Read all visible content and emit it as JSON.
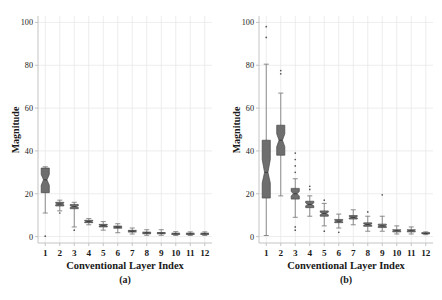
{
  "figure": {
    "background_color": "#ffffff",
    "box_fill_color": "#6e6e6e",
    "box_edge_color": "#4a4a4a",
    "whisker_color": "#808080",
    "grid_color": "#e8e8e8",
    "axis_color": "#bdbdbd",
    "text_color": "#1a1a1a"
  },
  "chart_data": [
    {
      "type": "box",
      "panel": "a",
      "caption": "(a)",
      "title": "",
      "xlabel": "Conventional Layer Index",
      "ylabel": "Magnitude",
      "categories": [
        "1",
        "2",
        "3",
        "4",
        "5",
        "6",
        "7",
        "8",
        "9",
        "10",
        "11",
        "12"
      ],
      "ytick_labels": [
        "0",
        "20",
        "40",
        "60",
        "80",
        "100"
      ],
      "yticks": [
        0,
        20,
        40,
        60,
        80,
        100
      ],
      "ylim": [
        -3,
        103
      ],
      "grid": true,
      "notched": true,
      "boxes": [
        {
          "x": 1,
          "whisker_low": 11.0,
          "q1": 20.5,
          "median": 26.5,
          "q3": 32.0,
          "whisker_high": 32.6,
          "notch_low": 24.0,
          "notch_high": 29.0,
          "outliers": [
            0.2
          ]
        },
        {
          "x": 2,
          "whisker_low": 12.0,
          "q1": 14.3,
          "median": 15.2,
          "q3": 16.0,
          "whisker_high": 17.0,
          "notch_low": 14.9,
          "notch_high": 15.6,
          "outliers": [
            11.0
          ]
        },
        {
          "x": 3,
          "whisker_low": 4.5,
          "q1": 13.0,
          "median": 14.0,
          "q3": 15.0,
          "whisker_high": 16.0,
          "notch_low": 13.6,
          "notch_high": 14.4,
          "outliers": [
            3.0
          ]
        },
        {
          "x": 4,
          "whisker_low": 5.5,
          "q1": 6.5,
          "median": 7.0,
          "q3": 7.6,
          "whisker_high": 8.4,
          "notch_low": 6.8,
          "notch_high": 7.3,
          "outliers": []
        },
        {
          "x": 5,
          "whisker_low": 3.0,
          "q1": 4.5,
          "median": 5.1,
          "q3": 5.7,
          "whisker_high": 7.0,
          "notch_low": 4.9,
          "notch_high": 5.4,
          "outliers": []
        },
        {
          "x": 6,
          "whisker_low": 1.8,
          "q1": 3.9,
          "median": 4.4,
          "q3": 4.9,
          "whisker_high": 6.0,
          "notch_low": 4.2,
          "notch_high": 4.7,
          "outliers": []
        },
        {
          "x": 7,
          "whisker_low": 1.2,
          "q1": 2.1,
          "median": 2.5,
          "q3": 2.9,
          "whisker_high": 4.0,
          "notch_low": 2.3,
          "notch_high": 2.7,
          "outliers": []
        },
        {
          "x": 8,
          "whisker_low": 0.6,
          "q1": 1.3,
          "median": 1.7,
          "q3": 2.1,
          "whisker_high": 3.2,
          "notch_low": 1.5,
          "notch_high": 1.9,
          "outliers": []
        },
        {
          "x": 9,
          "whisker_low": 0.6,
          "q1": 1.3,
          "median": 1.6,
          "q3": 1.9,
          "whisker_high": 3.2,
          "notch_low": 1.5,
          "notch_high": 1.8,
          "outliers": []
        },
        {
          "x": 10,
          "whisker_low": 0.5,
          "q1": 1.0,
          "median": 1.3,
          "q3": 1.6,
          "whisker_high": 2.3,
          "notch_low": 1.2,
          "notch_high": 1.5,
          "outliers": []
        },
        {
          "x": 11,
          "whisker_low": 0.5,
          "q1": 1.0,
          "median": 1.3,
          "q3": 1.6,
          "whisker_high": 2.2,
          "notch_low": 1.2,
          "notch_high": 1.5,
          "outliers": []
        },
        {
          "x": 12,
          "whisker_low": 0.5,
          "q1": 1.0,
          "median": 1.3,
          "q3": 1.6,
          "whisker_high": 2.2,
          "notch_low": 1.2,
          "notch_high": 1.5,
          "outliers": []
        }
      ]
    },
    {
      "type": "box",
      "panel": "b",
      "caption": "(b)",
      "title": "",
      "xlabel": "Conventional Layer Index",
      "ylabel": "Magnitude",
      "categories": [
        "1",
        "2",
        "3",
        "4",
        "5",
        "6",
        "7",
        "8",
        "9",
        "10",
        "11",
        "12"
      ],
      "ytick_labels": [
        "0",
        "20",
        "40",
        "60",
        "80",
        "100"
      ],
      "yticks": [
        0,
        20,
        40,
        60,
        80,
        100
      ],
      "ylim": [
        -3,
        103
      ],
      "grid": true,
      "notched": true,
      "boxes": [
        {
          "x": 1,
          "whisker_low": 0.5,
          "q1": 18.0,
          "median": 30.0,
          "q3": 45.0,
          "whisker_high": 80.5,
          "notch_low": 25.0,
          "notch_high": 36.0,
          "outliers": [
            93.0,
            98.0
          ]
        },
        {
          "x": 2,
          "whisker_low": 19.0,
          "q1": 38.0,
          "median": 45.0,
          "q3": 52.0,
          "whisker_high": 67.0,
          "notch_low": 42.0,
          "notch_high": 48.0,
          "outliers": [
            76.0,
            77.5
          ]
        },
        {
          "x": 3,
          "whisker_low": 9.0,
          "q1": 17.5,
          "median": 20.0,
          "q3": 22.5,
          "whisker_high": 27.0,
          "notch_low": 19.0,
          "notch_high": 21.0,
          "outliers": [
            3.0,
            4.5,
            30.0,
            33.0,
            36.0,
            39.0
          ]
        },
        {
          "x": 4,
          "whisker_low": 9.5,
          "q1": 13.5,
          "median": 15.0,
          "q3": 16.5,
          "whisker_high": 19.0,
          "notch_low": 14.4,
          "notch_high": 15.7,
          "outliers": [
            22.0,
            23.5
          ]
        },
        {
          "x": 5,
          "whisker_low": 5.0,
          "q1": 9.5,
          "median": 10.8,
          "q3": 12.0,
          "whisker_high": 15.5,
          "notch_low": 10.2,
          "notch_high": 11.4,
          "outliers": [
            2.5,
            17.0
          ]
        },
        {
          "x": 6,
          "whisker_low": 4.0,
          "q1": 6.5,
          "median": 7.2,
          "q3": 8.0,
          "whisker_high": 10.5,
          "notch_low": 6.9,
          "notch_high": 7.6,
          "outliers": [
            2.0
          ]
        },
        {
          "x": 7,
          "whisker_low": 5.5,
          "q1": 8.2,
          "median": 9.0,
          "q3": 9.8,
          "whisker_high": 12.5,
          "notch_low": 8.7,
          "notch_high": 9.4,
          "outliers": []
        },
        {
          "x": 8,
          "whisker_low": 2.5,
          "q1": 4.8,
          "median": 5.6,
          "q3": 6.4,
          "whisker_high": 9.5,
          "notch_low": 5.3,
          "notch_high": 6.0,
          "outliers": [
            11.5
          ]
        },
        {
          "x": 9,
          "whisker_low": 2.5,
          "q1": 4.2,
          "median": 5.0,
          "q3": 5.8,
          "whisker_high": 9.5,
          "notch_low": 4.7,
          "notch_high": 5.3,
          "outliers": [
            19.5
          ]
        },
        {
          "x": 10,
          "whisker_low": 1.2,
          "q1": 2.2,
          "median": 2.7,
          "q3": 3.2,
          "whisker_high": 5.0,
          "notch_low": 2.5,
          "notch_high": 3.0,
          "outliers": []
        },
        {
          "x": 11,
          "whisker_low": 1.2,
          "q1": 2.2,
          "median": 2.7,
          "q3": 3.2,
          "whisker_high": 4.5,
          "notch_low": 2.5,
          "notch_high": 3.0,
          "outliers": []
        },
        {
          "x": 12,
          "whisker_low": 0.9,
          "q1": 1.3,
          "median": 1.5,
          "q3": 1.8,
          "whisker_high": 2.2,
          "notch_low": 1.4,
          "notch_high": 1.7,
          "outliers": []
        }
      ]
    }
  ]
}
